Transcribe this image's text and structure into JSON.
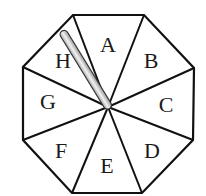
{
  "diagram": {
    "title": "",
    "shape": "regular octagon spinner",
    "colors": {
      "outline": "#111111",
      "background": "#ffffff",
      "needle_light": "#eeeeee",
      "needle_dark": "#9a9a9a"
    },
    "center": [
      108,
      107
    ],
    "sectors": [
      {
        "label": "A",
        "pos": [
          108,
          52
        ]
      },
      {
        "label": "B",
        "pos": [
          151,
          68
        ]
      },
      {
        "label": "C",
        "pos": [
          166,
          112
        ]
      },
      {
        "label": "D",
        "pos": [
          152,
          158
        ]
      },
      {
        "label": "E",
        "pos": [
          107,
          173
        ]
      },
      {
        "label": "F",
        "pos": [
          61,
          158
        ]
      },
      {
        "label": "G",
        "pos": [
          48,
          109
        ]
      },
      {
        "label": "H",
        "pos": [
          63,
          68
        ]
      }
    ],
    "needle": {
      "points_to": "H",
      "tip": [
        63,
        31
      ],
      "pivot": [
        108,
        106
      ]
    }
  }
}
